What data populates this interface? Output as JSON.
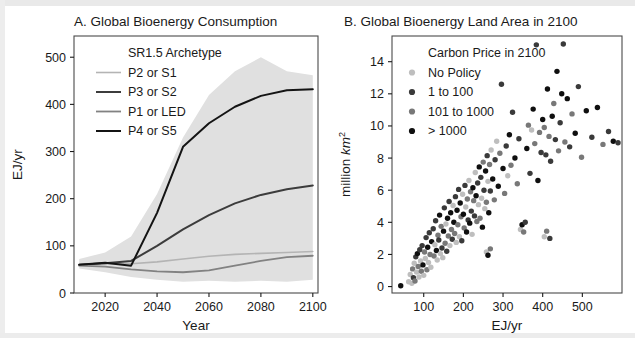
{
  "figure": {
    "background_color": "#ffffff",
    "width": 635,
    "height": 338
  },
  "panel_a": {
    "title": "A. Global Bioenergy Consumption",
    "legend_title": "SR1.5 Archetype",
    "legend_items": [
      {
        "label": "P2 or S1",
        "color": "#b4b4b4",
        "width": 1.6
      },
      {
        "label": "P3 or S2",
        "color": "#3c3c3c",
        "width": 2.0
      },
      {
        "label": "P1 or LED",
        "color": "#828282",
        "width": 1.8
      },
      {
        "label": "P4 or S5",
        "color": "#141414",
        "width": 2.0
      }
    ],
    "xlabel": "Year",
    "ylabel": "EJ/yr",
    "xticks": [
      2020,
      2040,
      2060,
      2080,
      2100
    ],
    "yticks": [
      0,
      100,
      200,
      300,
      400,
      500
    ],
    "xlim": [
      2008,
      2102
    ],
    "ylim": [
      0,
      545
    ],
    "band_color": "#e0e0e0"
  },
  "panel_b": {
    "title": "B. Global Bioenergy Land Area in 2100",
    "legend_title": "Carbon Price in 2100",
    "legend_items": [
      {
        "label": "No Policy",
        "color": "#bebebe"
      },
      {
        "label": "1 to 100",
        "color": "#3a3a3a"
      },
      {
        "label": "101 to 1000",
        "color": "#787878"
      },
      {
        "label": "> 1000",
        "color": "#0f0f0f"
      }
    ],
    "xlabel": "EJ/yr",
    "ylabel_prefix": "million ",
    "ylabel_italic": "km",
    "ylabel_sup": "2",
    "xticks": [
      100,
      200,
      300,
      400,
      500
    ],
    "yticks": [
      0,
      2,
      4,
      6,
      8,
      10,
      12,
      14
    ],
    "xlim": [
      20,
      600
    ],
    "ylim": [
      -0.4,
      15.6
    ]
  },
  "chart_data": [
    {
      "type": "line",
      "title": "A. Global Bioenergy Consumption",
      "xlabel": "Year",
      "ylabel": "EJ/yr",
      "xlim": [
        2008,
        2102
      ],
      "ylim": [
        0,
        545
      ],
      "xticks": [
        2020,
        2040,
        2060,
        2080,
        2100
      ],
      "yticks": [
        0,
        100,
        200,
        300,
        400,
        500
      ],
      "grid": false,
      "legend_position": "top-left-inside",
      "legend_title": "SR1.5 Archetype",
      "x": [
        2010,
        2020,
        2030,
        2040,
        2050,
        2060,
        2070,
        2080,
        2090,
        2100
      ],
      "series": [
        {
          "name": "P2 or S1",
          "color": "#b4b4b4",
          "values": [
            60,
            62,
            62,
            66,
            72,
            78,
            82,
            84,
            86,
            88
          ]
        },
        {
          "name": "P3 or S2",
          "color": "#3c3c3c",
          "values": [
            60,
            63,
            68,
            100,
            135,
            165,
            190,
            208,
            220,
            228
          ]
        },
        {
          "name": "P1 or LED",
          "color": "#828282",
          "values": [
            58,
            56,
            50,
            46,
            44,
            48,
            58,
            68,
            76,
            79
          ]
        },
        {
          "name": "P4 or S5",
          "color": "#141414",
          "values": [
            60,
            64,
            58,
            170,
            310,
            360,
            395,
            418,
            430,
            432
          ]
        }
      ],
      "uncertainty_band": {
        "color": "#e0e0e0",
        "upper": [
          72,
          86,
          120,
          210,
          330,
          420,
          470,
          500,
          470,
          462
        ],
        "lower": [
          52,
          44,
          34,
          28,
          24,
          26,
          24,
          26,
          24,
          28
        ]
      }
    },
    {
      "type": "scatter",
      "title": "B. Global Bioenergy Land Area in 2100",
      "xlabel": "EJ/yr",
      "ylabel": "million km^2",
      "xlim": [
        20,
        600
      ],
      "ylim": [
        -0.4,
        15.6
      ],
      "xticks": [
        100,
        200,
        300,
        400,
        500
      ],
      "yticks": [
        0,
        2,
        4,
        6,
        8,
        10,
        12,
        14
      ],
      "grid": false,
      "legend_position": "top-left-inside",
      "legend_title": "Carbon Price in 2100",
      "categories": [
        "No Policy",
        "1 to 100",
        "101 to 1000",
        "> 1000"
      ],
      "category_colors": [
        "#bebebe",
        "#3a3a3a",
        "#787878",
        "#0f0f0f"
      ],
      "points": [
        [
          42,
          0.05,
          3
        ],
        [
          62,
          0.3,
          0
        ],
        [
          66,
          0.75,
          0
        ],
        [
          70,
          0.2,
          0
        ],
        [
          72,
          1.1,
          2
        ],
        [
          74,
          0.55,
          1
        ],
        [
          76,
          1.45,
          0
        ],
        [
          78,
          0.35,
          2
        ],
        [
          80,
          1.85,
          1
        ],
        [
          82,
          0.9,
          0
        ],
        [
          84,
          2.05,
          3
        ],
        [
          86,
          1.25,
          2
        ],
        [
          88,
          0.6,
          0
        ],
        [
          90,
          2.3,
          1
        ],
        [
          92,
          1.6,
          0
        ],
        [
          94,
          0.95,
          2
        ],
        [
          96,
          2.55,
          1
        ],
        [
          98,
          1.35,
          3
        ],
        [
          100,
          0.7,
          0
        ],
        [
          102,
          2.15,
          2
        ],
        [
          104,
          1.75,
          0
        ],
        [
          106,
          3.05,
          1
        ],
        [
          108,
          1.05,
          2
        ],
        [
          110,
          2.45,
          3
        ],
        [
          112,
          1.5,
          0
        ],
        [
          114,
          3.35,
          1
        ],
        [
          116,
          2.0,
          2
        ],
        [
          118,
          1.2,
          0
        ],
        [
          120,
          2.8,
          3
        ],
        [
          124,
          3.6,
          1
        ],
        [
          126,
          1.9,
          2
        ],
        [
          128,
          2.6,
          0
        ],
        [
          130,
          4.1,
          1
        ],
        [
          132,
          2.25,
          3
        ],
        [
          134,
          1.65,
          0
        ],
        [
          136,
          3.2,
          2
        ],
        [
          138,
          2.9,
          1
        ],
        [
          140,
          4.45,
          3
        ],
        [
          142,
          2.05,
          0
        ],
        [
          144,
          3.75,
          2
        ],
        [
          146,
          2.4,
          1
        ],
        [
          148,
          1.8,
          0
        ],
        [
          150,
          3.45,
          3
        ],
        [
          152,
          4.9,
          1
        ],
        [
          154,
          2.7,
          2
        ],
        [
          156,
          3.9,
          0
        ],
        [
          158,
          2.2,
          1
        ],
        [
          160,
          4.25,
          3
        ],
        [
          162,
          3.15,
          2
        ],
        [
          164,
          5.3,
          1
        ],
        [
          166,
          2.55,
          0
        ],
        [
          168,
          4.6,
          3
        ],
        [
          170,
          3.55,
          2
        ],
        [
          172,
          2.95,
          1
        ],
        [
          174,
          5.05,
          0
        ],
        [
          176,
          4.0,
          3
        ],
        [
          178,
          3.3,
          2
        ],
        [
          180,
          5.6,
          1
        ],
        [
          182,
          2.75,
          0
        ],
        [
          184,
          4.75,
          3
        ],
        [
          186,
          3.85,
          2
        ],
        [
          188,
          6.05,
          1
        ],
        [
          190,
          3.1,
          0
        ],
        [
          192,
          5.2,
          3
        ],
        [
          194,
          4.35,
          2
        ],
        [
          196,
          2.85,
          1
        ],
        [
          198,
          5.75,
          0
        ],
        [
          200,
          4.5,
          3
        ],
        [
          202,
          3.65,
          2
        ],
        [
          204,
          6.3,
          1
        ],
        [
          206,
          4.95,
          0
        ],
        [
          208,
          3.4,
          3
        ],
        [
          210,
          5.45,
          2
        ],
        [
          212,
          4.15,
          1
        ],
        [
          214,
          6.6,
          0
        ],
        [
          216,
          3.95,
          3
        ],
        [
          218,
          5.9,
          2
        ],
        [
          220,
          4.7,
          1
        ],
        [
          222,
          3.25,
          0
        ],
        [
          224,
          6.15,
          3
        ],
        [
          226,
          5.35,
          2
        ],
        [
          228,
          4.4,
          1
        ],
        [
          230,
          7.1,
          0
        ],
        [
          232,
          5.65,
          3
        ],
        [
          234,
          4.05,
          2
        ],
        [
          236,
          6.45,
          1
        ],
        [
          238,
          5.1,
          0
        ],
        [
          240,
          7.45,
          3
        ],
        [
          242,
          4.25,
          2
        ],
        [
          244,
          6.8,
          1
        ],
        [
          246,
          5.5,
          0
        ],
        [
          248,
          3.7,
          3
        ],
        [
          250,
          7.75,
          2
        ],
        [
          252,
          6.0,
          1
        ],
        [
          254,
          4.85,
          0
        ],
        [
          256,
          7.2,
          3
        ],
        [
          258,
          5.25,
          2
        ],
        [
          260,
          8.15,
          1
        ],
        [
          262,
          6.55,
          0
        ],
        [
          264,
          4.6,
          3
        ],
        [
          266,
          7.6,
          2
        ],
        [
          268,
          5.95,
          1
        ],
        [
          270,
          8.5,
          0
        ],
        [
          274,
          6.7,
          3
        ],
        [
          278,
          5.4,
          2
        ],
        [
          280,
          7.9,
          1
        ],
        [
          284,
          9.05,
          0
        ],
        [
          288,
          6.25,
          3
        ],
        [
          292,
          8.3,
          2
        ],
        [
          296,
          12.6,
          1
        ],
        [
          300,
          7.35,
          3
        ],
        [
          304,
          5.8,
          2
        ],
        [
          308,
          8.75,
          1
        ],
        [
          312,
          6.9,
          0
        ],
        [
          316,
          9.45,
          3
        ],
        [
          320,
          7.55,
          2
        ],
        [
          324,
          10.85,
          1
        ],
        [
          330,
          8.0,
          3
        ],
        [
          336,
          6.4,
          2
        ],
        [
          340,
          9.2,
          1
        ],
        [
          344,
          3.55,
          0
        ],
        [
          348,
          3.85,
          3
        ],
        [
          352,
          3.4,
          2
        ],
        [
          356,
          4.0,
          1
        ],
        [
          360,
          8.6,
          3
        ],
        [
          364,
          10.05,
          2
        ],
        [
          368,
          7.05,
          1
        ],
        [
          372,
          9.75,
          0
        ],
        [
          376,
          11.05,
          3
        ],
        [
          380,
          8.9,
          2
        ],
        [
          384,
          15.05,
          1
        ],
        [
          388,
          6.6,
          3
        ],
        [
          392,
          9.6,
          2
        ],
        [
          396,
          8.35,
          1
        ],
        [
          400,
          10.4,
          3
        ],
        [
          404,
          9.9,
          2
        ],
        [
          408,
          8.2,
          1
        ],
        [
          412,
          12.3,
          3
        ],
        [
          416,
          9.35,
          2
        ],
        [
          420,
          7.8,
          1
        ],
        [
          424,
          10.6,
          3
        ],
        [
          428,
          11.4,
          2
        ],
        [
          432,
          9.15,
          1
        ],
        [
          436,
          13.4,
          3
        ],
        [
          440,
          8.45,
          2
        ],
        [
          444,
          10.2,
          1
        ],
        [
          448,
          12.0,
          3
        ],
        [
          452,
          15.1,
          1
        ],
        [
          456,
          9.0,
          2
        ],
        [
          462,
          11.7,
          3
        ],
        [
          468,
          8.7,
          1
        ],
        [
          474,
          10.75,
          2
        ],
        [
          482,
          9.55,
          3
        ],
        [
          490,
          12.45,
          1
        ],
        [
          498,
          8.05,
          2
        ],
        [
          510,
          10.95,
          3
        ],
        [
          524,
          9.3,
          1
        ],
        [
          538,
          11.15,
          3
        ],
        [
          552,
          8.85,
          2
        ],
        [
          566,
          9.65,
          1
        ],
        [
          578,
          9.05,
          3
        ],
        [
          590,
          8.95,
          1
        ],
        [
          404,
          3.1,
          0
        ],
        [
          410,
          3.45,
          2
        ],
        [
          418,
          3.0,
          1
        ],
        [
          258,
          2.15,
          0
        ],
        [
          262,
          1.95,
          3
        ],
        [
          268,
          2.35,
          2
        ]
      ],
      "point_format": "[x_EJ_per_yr, y_million_km2, category_index]"
    }
  ]
}
